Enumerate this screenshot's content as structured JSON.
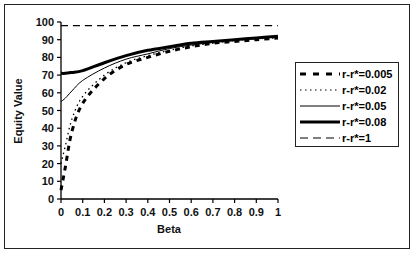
{
  "chart_data": {
    "type": "line",
    "title": "",
    "xlabel": "Beta",
    "ylabel": "Equity Value",
    "xlim": [
      0,
      1
    ],
    "ylim": [
      0,
      100
    ],
    "xticks": [
      "0",
      "0.1",
      "0.2",
      "0.3",
      "0.4",
      "0.5",
      "0.6",
      "0.7",
      "0.8",
      "0.9",
      "1"
    ],
    "yticks": [
      "0",
      "10",
      "20",
      "30",
      "40",
      "50",
      "60",
      "70",
      "80",
      "90",
      "100"
    ],
    "grid": false,
    "legend_position": "right",
    "x": [
      0,
      0.02,
      0.05,
      0.1,
      0.2,
      0.3,
      0.4,
      0.5,
      0.6,
      0.7,
      0.8,
      0.9,
      1.0
    ],
    "series": [
      {
        "name": "r-r*=0.005",
        "style": "thick-dashed",
        "values": [
          5,
          18,
          38,
          54,
          68,
          76,
          80,
          83.5,
          86,
          88,
          89,
          90,
          91
        ]
      },
      {
        "name": "r-r*=0.02",
        "style": "dotted",
        "values": [
          20,
          30,
          45,
          58,
          70,
          77,
          81,
          84,
          86.5,
          88,
          89.5,
          90.5,
          91
        ]
      },
      {
        "name": "r-r*=0.05",
        "style": "thin-solid",
        "values": [
          55,
          57,
          61,
          67,
          74,
          79,
          82,
          85,
          87,
          88.5,
          90,
          91,
          91.5
        ]
      },
      {
        "name": "r-r*=0.08",
        "style": "thick-solid",
        "values": [
          71,
          71,
          71.5,
          72.5,
          77,
          81,
          84,
          86,
          88,
          89,
          90,
          91,
          92
        ]
      },
      {
        "name": "r-r*=1",
        "style": "dashed",
        "values": [
          98,
          98,
          98,
          98,
          98,
          98,
          98,
          98,
          98,
          98,
          98,
          98,
          98
        ]
      }
    ]
  },
  "legend": {
    "items": [
      {
        "label": "r-r*=0.005"
      },
      {
        "label": "r-r*=0.02"
      },
      {
        "label": "r-r*=0.05"
      },
      {
        "label": "r-r*=0.08"
      },
      {
        "label": "r-r*=1"
      }
    ]
  },
  "axes": {
    "x_title": "Beta",
    "y_title": "Equity Value"
  }
}
